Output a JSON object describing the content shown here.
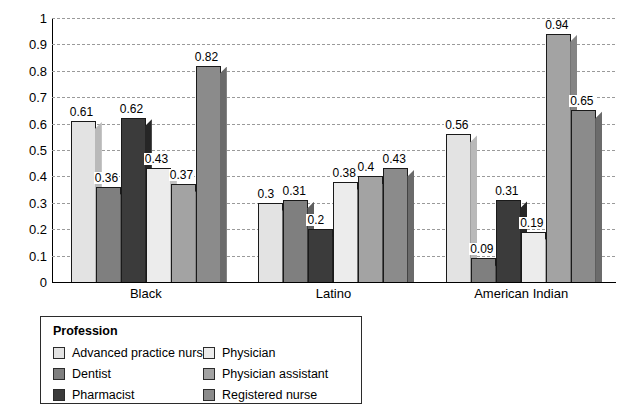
{
  "chart_data": {
    "type": "bar",
    "title": "",
    "xlabel": "",
    "ylabel": "",
    "ylim": [
      0,
      1
    ],
    "ytick_labels": [
      "1",
      "0.9",
      "0.8",
      "0.7",
      "0.6",
      "0.5",
      "0.4",
      "0.3",
      "0.2",
      "0.1",
      "0"
    ],
    "ytick_values": [
      1,
      0.9,
      0.8,
      0.7,
      0.6,
      0.5,
      0.4,
      0.3,
      0.2,
      0.1,
      0
    ],
    "grid": true,
    "grid_style": "dashed-horizontal",
    "legend_position": "below-left",
    "legend_title": "Profession",
    "categories": [
      "Black",
      "Latino",
      "American Indian"
    ],
    "series": [
      {
        "name": "Advanced practice nurse",
        "color": "#e3e3e3",
        "side_color": "#b9b9b9",
        "values": [
          0.61,
          0.3,
          0.56
        ],
        "labels": [
          "0.61",
          "0.3",
          "0.56"
        ]
      },
      {
        "name": "Dentist",
        "color": "#7f7f7f",
        "side_color": "#5f5f5f",
        "values": [
          0.36,
          0.31,
          0.09
        ],
        "labels": [
          "0.36",
          "0.31",
          "0.09"
        ]
      },
      {
        "name": "Pharmacist",
        "color": "#3b3b3b",
        "side_color": "#262626",
        "values": [
          0.62,
          0.2,
          0.31
        ],
        "labels": [
          "0.62",
          "0.2",
          "0.31"
        ]
      },
      {
        "name": "Physician",
        "color": "#ececec",
        "side_color": "#c2c2c2",
        "values": [
          0.43,
          0.38,
          0.19
        ],
        "labels": [
          "0.43",
          "0.38",
          "0.19"
        ]
      },
      {
        "name": "Physician assistant",
        "color": "#a3a3a3",
        "side_color": "#858585",
        "values": [
          0.37,
          0.4,
          0.94
        ],
        "labels": [
          "0.37",
          "0.4",
          "0.94"
        ]
      },
      {
        "name": "Registered nurse",
        "color": "#8b8b8b",
        "side_color": "#6b6b6b",
        "values": [
          0.82,
          0.43,
          0.65
        ],
        "labels": [
          "0.82",
          "0.43",
          "0.65"
        ]
      }
    ]
  },
  "legend": {
    "title": "Profession",
    "items": [
      {
        "label": "Advanced practice nurse",
        "color": "#e3e3e3"
      },
      {
        "label": "Dentist",
        "color": "#7f7f7f"
      },
      {
        "label": "Pharmacist",
        "color": "#3b3b3b"
      },
      {
        "label": "Physician",
        "color": "#ececec"
      },
      {
        "label": "Physician assistant",
        "color": "#a3a3a3"
      },
      {
        "label": "Registered nurse",
        "color": "#8b8b8b"
      }
    ]
  }
}
